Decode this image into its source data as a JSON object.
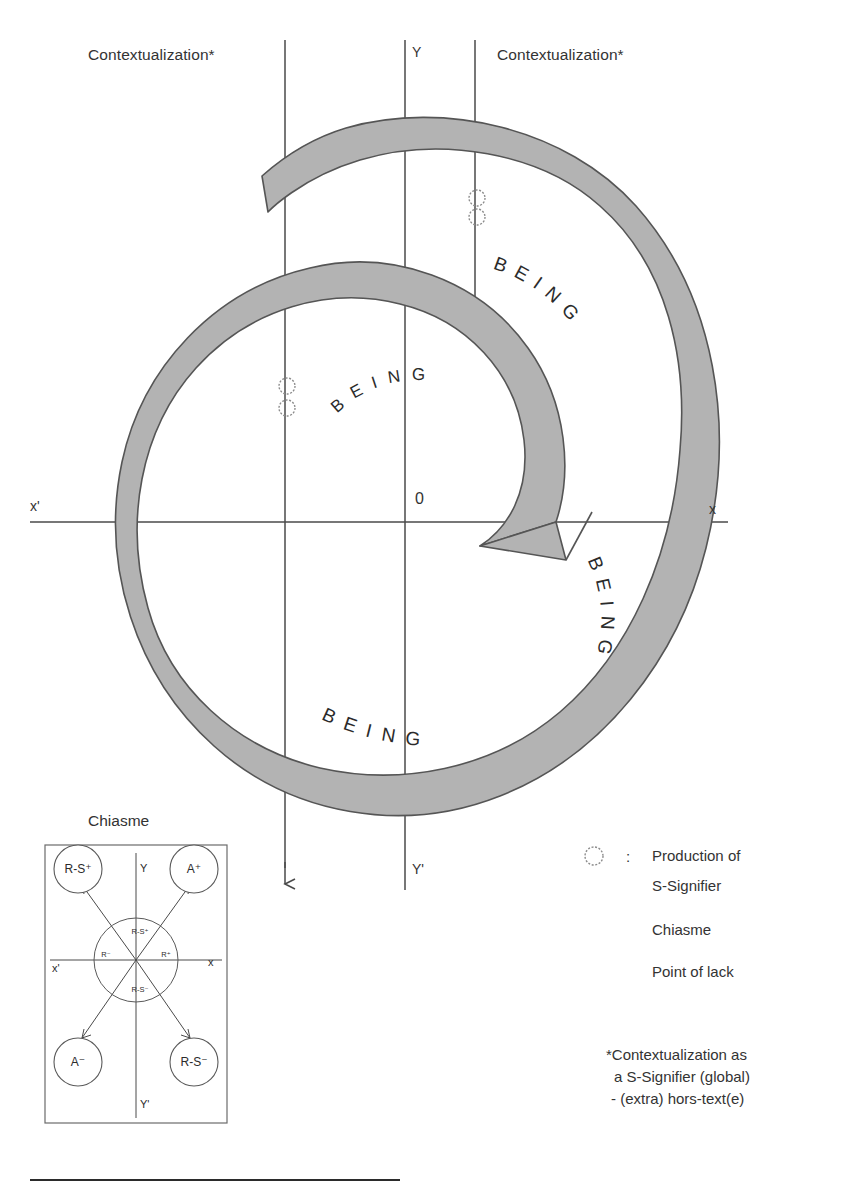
{
  "figure": {
    "title_top_left": "Contextualization*",
    "title_top_right": "Contextualization*",
    "axis_y_top": "Y",
    "axis_y_bottom": "Y'",
    "axis_x_left": "x'",
    "axis_x_right": "x",
    "origin_label": "0",
    "being_words": [
      {
        "id": "being-outer-upper-right",
        "text": "BEING"
      },
      {
        "id": "being-inner-top",
        "text": "BEING"
      },
      {
        "id": "being-outer-lower-right",
        "text": "BEING"
      },
      {
        "id": "being-outer-bottom",
        "text": "BEING"
      }
    ],
    "being_letters": [
      "B",
      "E",
      "I",
      "N",
      "G"
    ],
    "colors": {
      "spiral_fill": "#b3b3b3",
      "spiral_stroke": "#555555",
      "axis_line": "#4a4a4a",
      "text": "#333333",
      "marker_stroke": "#8c8c8c"
    }
  },
  "chiasme": {
    "title": "Chiasme",
    "axis_y_top": "Y",
    "axis_y_bottom": "Y'",
    "axis_x_left": "x'",
    "axis_x_right": "x",
    "outer_nodes": [
      {
        "id": "node-top-left",
        "label": "R-S⁺"
      },
      {
        "id": "node-top-right",
        "label": "A⁺"
      },
      {
        "id": "node-bottom-left",
        "label": "A⁻"
      },
      {
        "id": "node-bottom-right",
        "label": "R-S⁻"
      }
    ],
    "inner_labels": [
      {
        "id": "inner-top",
        "label": "R-S⁺"
      },
      {
        "id": "inner-left",
        "label": "R⁻"
      },
      {
        "id": "inner-right",
        "label": "R⁺"
      },
      {
        "id": "inner-bottom",
        "label": "R-S⁻"
      }
    ]
  },
  "legend": {
    "marker_icon": "circle-marker-icon",
    "separator": ":",
    "entries": [
      "Production of",
      "S-Signifier",
      "Chiasme",
      "Point of lack"
    ]
  },
  "footnote": {
    "lines": [
      "*Contextualization as",
      "a S-Signifier (global)",
      "- (extra) hors-text(e)"
    ]
  }
}
